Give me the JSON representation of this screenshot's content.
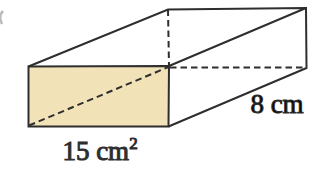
{
  "figure": {
    "type": "rectangular-prism-diagram",
    "labels": {
      "shaded_face_area_base": "15 cm",
      "shaded_face_area_exponent": "2",
      "depth_edge_length": "8 cm"
    },
    "colors": {
      "shaded_face_fill": "#f2e2b8",
      "line": "#2e2e2e"
    }
  }
}
